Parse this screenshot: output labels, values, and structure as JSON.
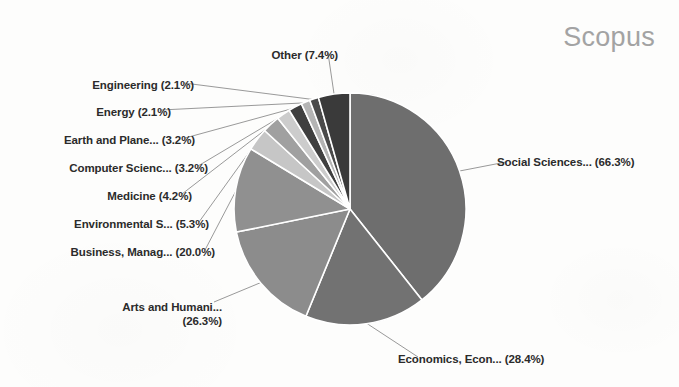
{
  "title": "Scopus",
  "background_color": "#fdfdfc",
  "title_color": "#a3a3a3",
  "label_color": "#2b2b2b",
  "leader_color": "#8d8d8d",
  "slice_divider_color": "#ffffff",
  "chart_data": {
    "type": "pie",
    "title": "Scopus",
    "xlabel": "",
    "ylabel": "",
    "grid": false,
    "legend": "none",
    "label_format": "{name} ({value}%)",
    "note": "Percentages are shares of documents per subject area and sum to more than 100% because documents may be classified under multiple subject areas; wedge angles are proportional to each value divided by the total of all values.",
    "total_of_values": 168.5,
    "categories": [
      "Social Sciences...",
      "Economics, Econ...",
      "Arts and Humani...",
      "Business, Manag...",
      "Environmental S...",
      "Medicine",
      "Computer Scienc...",
      "Earth and Plane...",
      "Energy",
      "Engineering",
      "Other"
    ],
    "values": [
      66.3,
      28.4,
      26.3,
      20.0,
      5.3,
      4.2,
      3.2,
      3.2,
      2.1,
      2.1,
      7.4
    ],
    "colors": [
      "#6e6e6e",
      "#727272",
      "#8c8c8c",
      "#909090",
      "#c6c6c6",
      "#a0a0a0",
      "#cccccc",
      "#3f3f3f",
      "#b4b4b4",
      "#4a4a4a",
      "#3a3a3a"
    ],
    "slices": [
      {
        "name": "Social Sciences...",
        "value": 66.3,
        "label": "Social Sciences... (66.3%)",
        "color": "#6e6e6e"
      },
      {
        "name": "Economics, Econ...",
        "value": 28.4,
        "label": "Economics, Econ... (28.4%)",
        "color": "#727272"
      },
      {
        "name": "Arts and Humani...",
        "value": 26.3,
        "label_line1": "Arts and Humani...",
        "label_line2": "(26.3%)",
        "color": "#8c8c8c"
      },
      {
        "name": "Business, Manag...",
        "value": 20.0,
        "label": "Business, Manag... (20.0%)",
        "color": "#909090"
      },
      {
        "name": "Environmental S...",
        "value": 5.3,
        "label": "Environmental S... (5.3%)",
        "color": "#c6c6c6"
      },
      {
        "name": "Medicine",
        "value": 4.2,
        "label": "Medicine (4.2%)",
        "color": "#a0a0a0"
      },
      {
        "name": "Computer Scienc...",
        "value": 3.2,
        "label": "Computer Scienc... (3.2%)",
        "color": "#cccccc"
      },
      {
        "name": "Earth and Plane...",
        "value": 3.2,
        "label": "Earth and Plane... (3.2%)",
        "color": "#3f3f3f"
      },
      {
        "name": "Energy",
        "value": 2.1,
        "label": "Energy (2.1%)",
        "color": "#b4b4b4"
      },
      {
        "name": "Engineering",
        "value": 2.1,
        "label": "Engineering (2.1%)",
        "color": "#4a4a4a"
      },
      {
        "name": "Other",
        "value": 7.4,
        "label": "Other (7.4%)",
        "color": "#3a3a3a"
      }
    ]
  },
  "labels": {
    "social_sciences": "Social Sciences... (66.3%)",
    "economics": "Economics, Econ... (28.4%)",
    "arts_line1": "Arts and Humani...",
    "arts_line2": "(26.3%)",
    "business": "Business, Manag... (20.0%)",
    "environmental": "Environmental S... (5.3%)",
    "medicine": "Medicine (4.2%)",
    "computer_science": "Computer Scienc... (3.2%)",
    "earth": "Earth and Plane... (3.2%)",
    "energy": "Energy (2.1%)",
    "engineering": "Engineering (2.1%)",
    "other": "Other (7.4%)"
  },
  "geometry": {
    "center_x": 350,
    "center_y": 209,
    "radius": 116
  }
}
